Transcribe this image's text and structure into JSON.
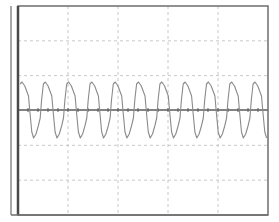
{
  "colors": {
    "background": "#ffffff",
    "frame": "#6e6e6e",
    "left_axis": "#4a4a4a",
    "grid": "#c8c8c8",
    "center_axis": "#5a5a5a",
    "trace": "#8a8a8a"
  },
  "frame": {
    "x0": 18,
    "y0": 6,
    "x1": 268,
    "y1": 215,
    "outer_left_x": 11
  },
  "grid": {
    "x_divisions": 5,
    "y_divisions": 6,
    "center_y": 110,
    "tick_spacing": 10
  },
  "chart_data": {
    "type": "line",
    "title": "",
    "xlabel": "",
    "ylabel": "",
    "grid": true,
    "legend": null,
    "period_px": 23.3,
    "cycles": 11,
    "x_range_px": [
      18,
      268
    ],
    "y_peak_px": 82,
    "y_trough_px": 138,
    "y_center_px": 110,
    "cycle_shape": [
      {
        "t": 0.0,
        "y": 82
      },
      {
        "t": 0.12,
        "y": 86
      },
      {
        "t": 0.28,
        "y": 96
      },
      {
        "t": 0.34,
        "y": 112
      },
      {
        "t": 0.42,
        "y": 132
      },
      {
        "t": 0.5,
        "y": 138
      },
      {
        "t": 0.6,
        "y": 134
      },
      {
        "t": 0.7,
        "y": 126
      },
      {
        "t": 0.78,
        "y": 118
      },
      {
        "t": 0.84,
        "y": 100
      },
      {
        "t": 0.92,
        "y": 84
      },
      {
        "t": 1.0,
        "y": 82
      }
    ]
  }
}
